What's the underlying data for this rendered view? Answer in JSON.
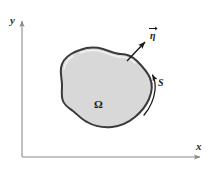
{
  "figure": {
    "type": "math-diagram",
    "background_color": "#ffffff"
  },
  "axes": {
    "x_label": "x",
    "y_label": "y",
    "line_color": "#b0b0b0",
    "arrow_color": "#8a8a8a",
    "origin": {
      "x": 22,
      "y": 157
    },
    "x_end": {
      "x": 205,
      "y": 157
    },
    "y_end": {
      "x": 22,
      "y": 17
    }
  },
  "region": {
    "label": "Ω",
    "label_position": {
      "x": 97,
      "y": 104
    },
    "fill_color": "#d8d8d8",
    "stroke_color": "#3a3a3a",
    "highlight_color": "#efefef",
    "stroke_width": 2
  },
  "normal_vector": {
    "label": "η",
    "accent": "vector-arrow-overbar",
    "label_position": {
      "x": 150,
      "y": 37
    },
    "arrow_start": {
      "x": 127,
      "y": 61
    },
    "arrow_end": {
      "x": 147,
      "y": 40
    },
    "color": "#1a1a1a"
  },
  "surface": {
    "label": "S",
    "label_position": {
      "x": 159,
      "y": 83
    },
    "arc_start": {
      "x": 148,
      "y": 113
    },
    "arc_end": {
      "x": 151,
      "y": 73
    },
    "arrow_direction": "counterclockwise-upward",
    "color": "#1a1a1a"
  }
}
